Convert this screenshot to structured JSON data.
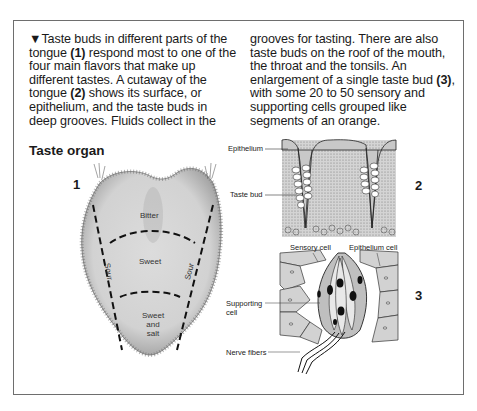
{
  "caption": {
    "marker": "▼",
    "column1_lines": [
      "Taste buds in different parts of the",
      [
        "tongue ",
        "(1)",
        " respond most to one of the"
      ],
      "four main flavors that make up",
      "different tastes. A cutaway of the",
      [
        "tongue ",
        "(2)",
        " shows its surface, or"
      ],
      "epithelium, and the taste buds in",
      "deep grooves. Fluids collect in the"
    ],
    "column2_lines": [
      "grooves for tasting. There are also",
      "taste buds on the roof of the mouth,",
      "the throat and the tonsils. An",
      [
        "enlargement of a single taste bud ",
        "(3)",
        ","
      ],
      "with some 20 to 50 sensory and",
      "supporting cells grouped like",
      "segments of an orange."
    ]
  },
  "figure": {
    "heading": "Taste organ",
    "numbers": {
      "one": "1",
      "two": "2",
      "three": "3"
    },
    "tongue_regions": {
      "bitter": "Bitter",
      "sweet": "Sweet",
      "sour_left": "Sour",
      "sour_right": "Sour",
      "sweet_salt_1": "Sweet",
      "sweet_salt_2": "and",
      "sweet_salt_3": "salt"
    },
    "cutaway_labels": {
      "epithelium": "Epithelium",
      "taste_bud": "Taste bud"
    },
    "bud_labels": {
      "sensory_cell": "Sensory cell",
      "epithelium_cell": "Epithelium cell",
      "supporting_1": "Supporting",
      "supporting_2": "cell",
      "nerve_fibers": "Nerve fibers"
    },
    "colors": {
      "border": "#6e6e6e",
      "tissue": "#d9d9d9",
      "ink": "#1a1a1a"
    }
  }
}
